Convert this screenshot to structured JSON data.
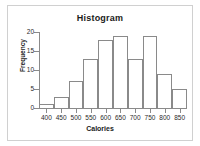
{
  "chart_data": {
    "type": "bar",
    "title": "Histogram",
    "xlabel": "Calories",
    "ylabel": "Frequency",
    "bin_width": 50,
    "bin_starts": [
      375,
      425,
      475,
      525,
      575,
      625,
      675,
      725,
      775,
      825
    ],
    "categories": [
      "375-425",
      "425-475",
      "475-525",
      "525-575",
      "575-625",
      "625-675",
      "675-725",
      "725-775",
      "775-825",
      "825-875"
    ],
    "values": [
      1,
      3,
      7,
      13,
      18,
      19,
      13,
      19,
      9,
      5
    ],
    "xlim": [
      375,
      875
    ],
    "ylim": [
      0,
      20
    ],
    "xticks": [
      400,
      450,
      500,
      550,
      600,
      650,
      700,
      750,
      800,
      850
    ],
    "xtick_labels": [
      "400",
      "450",
      "500",
      "550",
      "600",
      "650",
      "700",
      "750",
      "800",
      "850"
    ],
    "yticks": [
      0,
      5,
      10,
      15,
      20
    ],
    "ytick_labels": [
      "0",
      "5",
      "10",
      "15",
      "20"
    ],
    "grid": false,
    "legend": null,
    "bar_fill_color": "#ffffff",
    "bar_edge_color": "#8a8a8a",
    "axis_color": "#8a8a8a",
    "text_color": "#1a1a1a",
    "background_color": "#ffffff",
    "frame_color": "#d0d0d0"
  }
}
